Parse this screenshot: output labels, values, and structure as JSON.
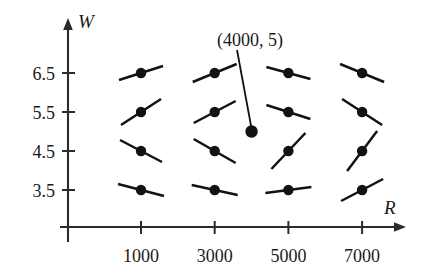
{
  "chart_data": {
    "type": "scatter",
    "title": "",
    "subtitle": "",
    "xlabel": "R",
    "ylabel": "W",
    "grid": false,
    "legend": null,
    "xlim": [
      0,
      8000
    ],
    "ylim": [
      2.8,
      7.2
    ],
    "x_ticks": [
      1000,
      3000,
      5000,
      7000
    ],
    "x_tick_labels": [
      "1000",
      "3000",
      "5000",
      "7000"
    ],
    "y_ticks": [
      3.5,
      4.5,
      5.5,
      6.5
    ],
    "y_tick_labels": [
      "3.5",
      "4.5",
      "5.5",
      "6.5"
    ],
    "points": [
      {
        "x": 1000,
        "y": 6.5,
        "slope_dx": 22,
        "slope_dy": -7,
        "has_segment": true
      },
      {
        "x": 3000,
        "y": 6.5,
        "slope_dx": 22,
        "slope_dy": -9,
        "has_segment": true
      },
      {
        "x": 5000,
        "y": 6.5,
        "slope_dx": 22,
        "slope_dy": 6,
        "has_segment": true
      },
      {
        "x": 7000,
        "y": 6.5,
        "slope_dx": 22,
        "slope_dy": 9,
        "has_segment": true
      },
      {
        "x": 1000,
        "y": 5.5,
        "slope_dx": 20,
        "slope_dy": -13,
        "has_segment": true
      },
      {
        "x": 3000,
        "y": 5.5,
        "slope_dx": 21,
        "slope_dy": -11,
        "has_segment": true
      },
      {
        "x": 5000,
        "y": 5.5,
        "slope_dx": 22,
        "slope_dy": 7,
        "has_segment": true
      },
      {
        "x": 7000,
        "y": 5.5,
        "slope_dx": 20,
        "slope_dy": 13,
        "has_segment": true
      },
      {
        "x": 1000,
        "y": 4.5,
        "slope_dx": 21,
        "slope_dy": 11,
        "has_segment": true
      },
      {
        "x": 3000,
        "y": 4.5,
        "slope_dx": 21,
        "slope_dy": 12,
        "has_segment": true
      },
      {
        "x": 5000,
        "y": 4.5,
        "slope_dx": 17,
        "slope_dy": -18,
        "has_segment": true
      },
      {
        "x": 7000,
        "y": 4.5,
        "slope_dx": 15,
        "slope_dy": -20,
        "has_segment": true
      },
      {
        "x": 1000,
        "y": 3.5,
        "slope_dx": 23,
        "slope_dy": 6,
        "has_segment": true
      },
      {
        "x": 3000,
        "y": 3.5,
        "slope_dx": 23,
        "slope_dy": 5,
        "has_segment": true
      },
      {
        "x": 5000,
        "y": 3.5,
        "slope_dx": 23,
        "slope_dy": -3,
        "has_segment": true
      },
      {
        "x": 7000,
        "y": 3.5,
        "slope_dx": 21,
        "slope_dy": -11,
        "has_segment": true
      }
    ],
    "highlight_point": {
      "x": 4000,
      "y": 5,
      "label": "(4000, 5)",
      "has_segment": false
    },
    "annotations": [
      {
        "text": "(4000, 5)",
        "target_x": 4000,
        "target_y": 5
      }
    ]
  },
  "axes": {
    "y_axis_title": "W",
    "x_axis_title": "R"
  },
  "colors": {
    "ink": "#121212",
    "axis": "#2b2b2b",
    "background": "#ffffff"
  }
}
